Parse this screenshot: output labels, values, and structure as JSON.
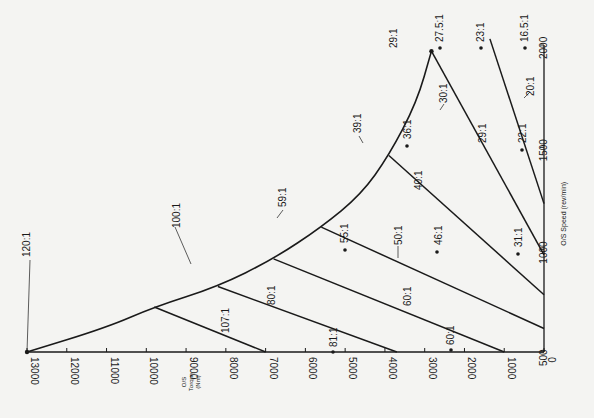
{
  "chart_data": {
    "type": "line",
    "title": "",
    "orientation": "rotated 90deg (torque axis horizontal at bottom, reading right-to-left; speed axis vertical at right)",
    "xlabel": "O/S Speed (rev/min)",
    "ylabel": "O/S Torque (Nm)",
    "speed_axis": {
      "label": "O/S Speed (rev/min)",
      "ticks": [
        500,
        1000,
        1500,
        2000
      ],
      "range": [
        500,
        2000
      ]
    },
    "torque_axis": {
      "label_lines": [
        "O/S",
        "Torque",
        "(Nm)"
      ],
      "ticks": [
        0,
        1000,
        2000,
        3000,
        4000,
        5000,
        6000,
        7000,
        8000,
        9000,
        10000,
        11000,
        12000,
        13000
      ],
      "range": [
        0,
        13000
      ]
    },
    "envelope": {
      "name": "max torque envelope",
      "points": [
        {
          "speed": 500,
          "torque": 13000
        },
        {
          "speed": 620,
          "torque": 11000
        },
        {
          "speed": 720,
          "torque": 9800
        },
        {
          "speed": 820,
          "torque": 8200
        },
        {
          "speed": 955,
          "torque": 6800
        },
        {
          "speed": 1110,
          "torque": 5600
        },
        {
          "speed": 1270,
          "torque": 4600
        },
        {
          "speed": 1460,
          "torque": 3900
        },
        {
          "speed": 1720,
          "torque": 3200
        },
        {
          "speed": 1970,
          "torque": 2830
        }
      ]
    },
    "ratio_lines": [
      {
        "ratio": "107:1",
        "points": [
          {
            "speed": 720,
            "torque": 9800
          },
          {
            "speed": 500,
            "torque": 7000
          }
        ]
      },
      {
        "ratio": "80:1",
        "points": [
          {
            "speed": 820,
            "torque": 8200
          },
          {
            "speed": 500,
            "torque": 3700
          }
        ]
      },
      {
        "ratio": "60:1",
        "points": [
          {
            "speed": 955,
            "torque": 6800
          },
          {
            "speed": 500,
            "torque": 1000
          }
        ]
      },
      {
        "ratio": "50:1",
        "points": [
          {
            "speed": 1110,
            "torque": 5600
          },
          {
            "speed": 615,
            "torque": 0
          }
        ]
      },
      {
        "ratio": "40:1",
        "points": [
          {
            "speed": 1460,
            "torque": 3900
          },
          {
            "speed": 780,
            "torque": 0
          }
        ]
      },
      {
        "ratio": "30:1 / 29:1",
        "points": [
          {
            "speed": 1970,
            "torque": 2830
          },
          {
            "speed": 975,
            "torque": 0
          }
        ]
      },
      {
        "ratio": "20:1",
        "points": [
          {
            "speed": 2030,
            "torque": 1360
          },
          {
            "speed": 1225,
            "torque": 0
          }
        ]
      }
    ],
    "curve_labels": [
      {
        "text": "120:1",
        "speed": 500,
        "torque": 13000
      },
      {
        "text": "100:1",
        "speed": 720,
        "torque": 9800
      },
      {
        "text": "59:1",
        "speed": 955,
        "torque": 6800
      },
      {
        "text": "39:1",
        "speed": 1460,
        "torque": 3900
      },
      {
        "text": "29:1",
        "speed": 1970,
        "torque": 2830
      }
    ],
    "point_labels": [
      {
        "text": "81:1",
        "speed": 500,
        "torque": 2850
      },
      {
        "text": "60:1",
        "speed": 500,
        "torque": 880
      },
      {
        "text": "55:1",
        "speed": 1000,
        "torque": 5100
      },
      {
        "text": "46:1",
        "speed": 1000,
        "torque": 3400
      },
      {
        "text": "31:1",
        "speed": 1000,
        "torque": 1450
      },
      {
        "text": "36:1",
        "speed": 1500,
        "torque": 3500
      },
      {
        "text": "22:1",
        "speed": 1500,
        "torque": 1500
      },
      {
        "text": "27.5:1",
        "speed": 2000,
        "torque": 3000
      },
      {
        "text": "23:1",
        "speed": 2000,
        "torque": 1700
      },
      {
        "text": "16.5:1",
        "speed": 2000,
        "torque": 800
      }
    ],
    "line_labels": [
      {
        "text": "107:1",
        "on": "107:1"
      },
      {
        "text": "80:1",
        "on": "80:1"
      },
      {
        "text": "60:1",
        "on": "60:1"
      },
      {
        "text": "50:1",
        "on": "50:1"
      },
      {
        "text": "40:1",
        "on": "40:1"
      },
      {
        "text": "30:1",
        "on": "30:1 / 29:1"
      },
      {
        "text": "29:1",
        "on": "30:1 / 29:1"
      },
      {
        "text": "20:1",
        "on": "20:1"
      }
    ],
    "grid": false,
    "legend": "none"
  },
  "labels": {
    "speed_axis_label": "O/S Speed (rev/min)",
    "torque_axis_label_1": "O/S",
    "torque_axis_label_2": "Torque",
    "torque_axis_label_3": "(Nm)"
  },
  "colors": {
    "ink": "#1a1a1a",
    "paper": "#f4f4f2"
  }
}
